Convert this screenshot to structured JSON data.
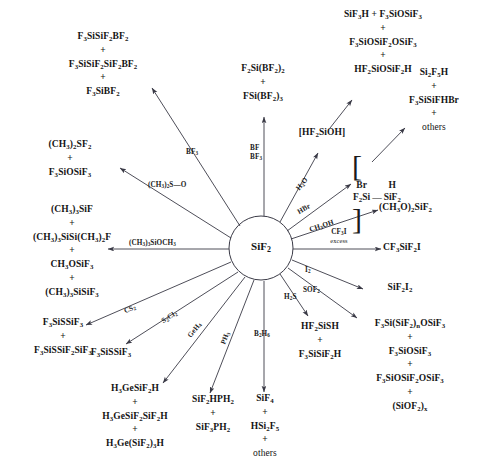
{
  "diagram": {
    "center": {
      "label": "SiF<sub>2</sub>",
      "plain": "SiF2"
    },
    "branches": [
      {
        "id": "bf3-left",
        "reagent": "BF<sub>3</sub>",
        "products": [
          "F<sub>3</sub>SiSiF<sub>2</sub>BF<sub>2</sub>",
          "+",
          "F<sub>3</sub>SiSiF<sub>2</sub>SiF<sub>2</sub>BF<sub>2</sub>",
          "+",
          "F<sub>3</sub>SiBF<sub>2</sub>"
        ]
      },
      {
        "id": "dmso",
        "reagent": "(CH<sub>3</sub>)<sub>2</sub>S&#8212;O",
        "products": [
          "(CH<sub>3</sub>)<sub>2</sub>SF<sub>2</sub>",
          "+",
          "F<sub>3</sub>SiOSiF<sub>3</sub>"
        ]
      },
      {
        "id": "tms-methoxide",
        "reagent": "(CH<sub>3</sub>)<sub>3</sub>SiOCH<sub>3</sub>",
        "products": [
          "(CH<sub>3</sub>)<sub>3</sub>SiF",
          "+",
          "(CH<sub>3</sub>)<sub>3</sub>SiSi(CH<sub>3</sub>)<sub>2</sub>F",
          "+",
          "CH<sub>3</sub>OSiF<sub>3</sub>",
          "+",
          "(CH<sub>3</sub>)<sub>3</sub>SiSiF<sub>3</sub>"
        ]
      },
      {
        "id": "cs2",
        "reagent": "CS<sub>2</sub>",
        "products": [
          "F<sub>3</sub>SiSSiF<sub>3</sub>",
          "+",
          "F<sub>3</sub>SiSSiF<sub>2</sub>SiF<sub>3</sub>"
        ]
      },
      {
        "id": "s2cl2",
        "reagent": "S<sub>2</sub>Cl<sub>2</sub>",
        "products": [
          "F<sub>3</sub>SiSSiF<sub>3</sub>"
        ]
      },
      {
        "id": "geh4",
        "reagent": "GeH<sub>4</sub>",
        "products": [
          "H<sub>3</sub>GeSiF<sub>2</sub>H",
          "+",
          "H<sub>3</sub>GeSiF<sub>2</sub>SiF<sub>2</sub>H",
          "+",
          "H<sub>3</sub>Ge(SiF<sub>2</sub>)<sub>3</sub>H"
        ]
      },
      {
        "id": "ph3",
        "reagent": "PH<sub>3</sub>",
        "products": [
          "SiF<sub>2</sub>HPH<sub>2</sub>",
          "+",
          "SiF<sub>3</sub>PH<sub>2</sub>"
        ]
      },
      {
        "id": "b2h6",
        "reagent": "B<sub>2</sub>H<sub>6</sub>",
        "products": [
          "SiF<sub>4</sub>",
          "+",
          "HSi<sub>2</sub>F<sub>5</sub>",
          "+",
          "others"
        ]
      },
      {
        "id": "h2s",
        "reagent": "H<sub>2</sub>S",
        "products": [
          "HF<sub>2</sub>SiSH",
          "+",
          "F<sub>3</sub>SiSiF<sub>2</sub>H"
        ]
      },
      {
        "id": "sof2",
        "reagent": "SOF<sub>2</sub>",
        "products": [
          "F<sub>3</sub>Si(SiF<sub>2</sub>)<sub>n</sub>OSiF<sub>3</sub>",
          "+",
          "F<sub>3</sub>SiOSiF<sub>3</sub>",
          "+",
          "F<sub>3</sub>SiOSiF<sub>2</sub>OSiF<sub>3</sub>",
          "+",
          "(SiOF<sub>2</sub>)<sub>x</sub>"
        ]
      },
      {
        "id": "i2",
        "reagent": "I<sub>2</sub>",
        "products": [
          "SiF<sub>2</sub>I<sub>2</sub>"
        ]
      },
      {
        "id": "cf3i",
        "reagent": "CF<sub>3</sub>I",
        "reagent_sub": "excess",
        "products": [
          "CF<sub>3</sub>SiF<sub>2</sub>I"
        ]
      },
      {
        "id": "ch3oh",
        "reagent": "CH<sub>3</sub>OH",
        "products": [
          "(CH<sub>3</sub>O)<sub>2</sub>SiF<sub>2</sub>"
        ]
      },
      {
        "id": "hbr",
        "reagent": "HBr",
        "intermediate": {
          "top_left": "Br",
          "top_right": "H",
          "bottom_left": "F<sub>2</sub>Si",
          "bottom_right": "SiF<sub>2</sub>",
          "bond": "&#8212;"
        },
        "products": [
          "Si<sub>2</sub>F<sub>5</sub>H",
          "+",
          "F<sub>3</sub>SiSiFHBr",
          "+",
          "others"
        ]
      },
      {
        "id": "h2o",
        "reagent": "H<sub>2</sub>O",
        "intermediate_label": "[HF<sub>2</sub>SiOH]",
        "products": [
          "SiF<sub>3</sub>H + F<sub>3</sub>SiOSiF<sub>3</sub>",
          "+",
          "F<sub>3</sub>SiOSiF<sub>2</sub>OSiF<sub>3</sub>",
          "+",
          "HF<sub>2</sub>SiOSiF<sub>2</sub>H"
        ]
      },
      {
        "id": "bf-bf3",
        "reagent_line1": "BF",
        "reagent_line2": "BF<sub>3</sub>",
        "products": [
          "F<sub>2</sub>Si(BF<sub>2</sub>)<sub>2</sub>",
          "+",
          "FSi(BF<sub>2</sub>)<sub>3</sub>"
        ]
      }
    ]
  },
  "style": {
    "line_color": "#3a3a46",
    "text_color": "#141414",
    "background": "#ffffff"
  }
}
